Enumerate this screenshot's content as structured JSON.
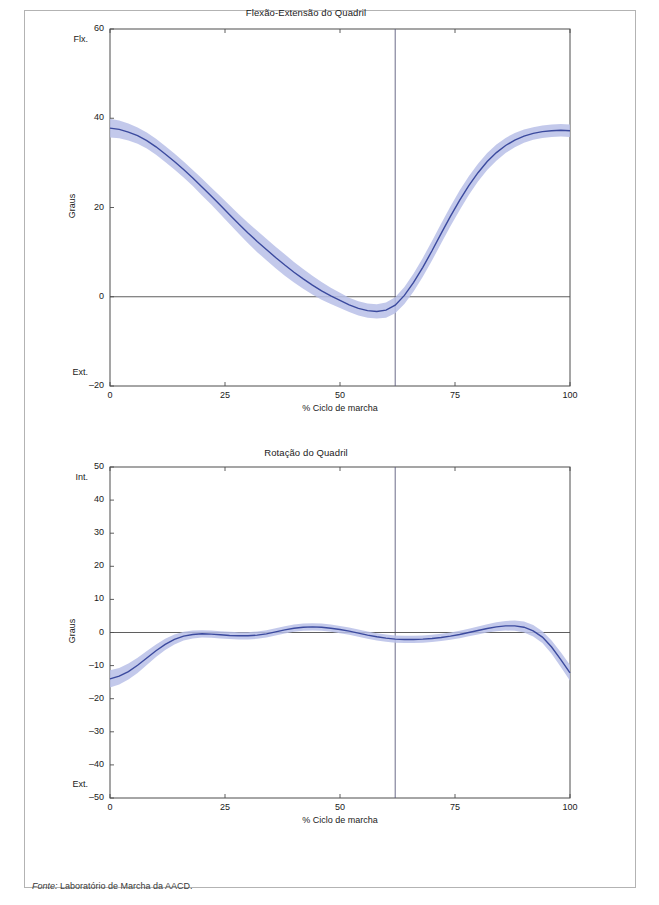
{
  "figure": {
    "source_prefix": "Fonte:",
    "source_text": " Laboratório de Marcha da AACD."
  },
  "colors": {
    "mean_line": "#3b4a9e",
    "band": "#b9c0e8",
    "axis": "#4d4d4d",
    "frame": "#b3b3b3",
    "event_line": "#5a5a7a"
  },
  "chart_data": [
    {
      "type": "line",
      "id": "flexao-extensao-quadril",
      "title": "Flexão-Extensão do Quadril",
      "xlabel": "% Ciclo de marcha",
      "ylabel": "Graus",
      "xlim": [
        0,
        100
      ],
      "ylim": [
        -20,
        60
      ],
      "grid": false,
      "legend": "none",
      "xticks": [
        0,
        25,
        50,
        75,
        100
      ],
      "xtick_labels": [
        "0",
        "25",
        "50",
        "75",
        "100"
      ],
      "yticks": [
        -20,
        0,
        20,
        40,
        60
      ],
      "ytick_labels": [
        "–20",
        "0",
        "20",
        "40",
        "60"
      ],
      "axis_end_labels": {
        "top": "Flx.",
        "bottom": "Ext."
      },
      "annotations": [
        {
          "type": "vline",
          "x": 62,
          "label": "toe-off"
        },
        {
          "type": "hline",
          "y": 0,
          "label": "zero-degrees"
        }
      ],
      "x": [
        0,
        2,
        4,
        6,
        8,
        10,
        12,
        14,
        16,
        18,
        20,
        22,
        24,
        26,
        28,
        30,
        32,
        34,
        36,
        38,
        40,
        42,
        44,
        46,
        48,
        50,
        52,
        54,
        56,
        58,
        60,
        62,
        64,
        66,
        68,
        70,
        72,
        74,
        76,
        78,
        80,
        82,
        84,
        86,
        88,
        90,
        92,
        94,
        96,
        98,
        100
      ],
      "series": [
        {
          "name": "Média",
          "values": [
            37.8,
            37.5,
            36.9,
            36.1,
            35.0,
            33.6,
            32.0,
            30.3,
            28.5,
            26.6,
            24.6,
            22.6,
            20.5,
            18.4,
            16.3,
            14.3,
            12.4,
            10.6,
            8.8,
            7.1,
            5.5,
            4.0,
            2.6,
            1.3,
            0.2,
            -0.8,
            -1.8,
            -2.6,
            -3.1,
            -3.3,
            -3.0,
            -1.9,
            0.3,
            3.2,
            6.6,
            10.3,
            14.2,
            18.0,
            21.6,
            24.9,
            27.8,
            30.3,
            32.3,
            33.9,
            35.1,
            36.0,
            36.6,
            37.0,
            37.2,
            37.3,
            37.2
          ]
        },
        {
          "name": "Desvio superior",
          "values": [
            39.9,
            39.5,
            38.8,
            37.9,
            36.8,
            35.4,
            33.8,
            32.1,
            30.3,
            28.4,
            26.5,
            24.5,
            22.5,
            20.5,
            18.5,
            16.6,
            14.8,
            13.0,
            11.2,
            9.5,
            7.8,
            6.2,
            4.7,
            3.3,
            2.0,
            0.9,
            -0.2,
            -1.0,
            -1.5,
            -1.7,
            -1.3,
            -0.1,
            2.2,
            5.2,
            8.7,
            12.5,
            16.4,
            20.2,
            23.8,
            27.0,
            29.8,
            32.2,
            34.1,
            35.6,
            36.7,
            37.5,
            38.0,
            38.4,
            38.6,
            38.7,
            38.6
          ]
        },
        {
          "name": "Desvio inferior",
          "values": [
            35.7,
            35.5,
            35.0,
            34.3,
            33.2,
            31.8,
            30.2,
            28.5,
            26.7,
            24.8,
            22.7,
            20.7,
            18.5,
            16.3,
            14.1,
            12.0,
            10.0,
            8.2,
            6.4,
            4.7,
            3.2,
            1.8,
            0.5,
            -0.7,
            -1.6,
            -2.5,
            -3.4,
            -4.2,
            -4.7,
            -4.9,
            -4.7,
            -3.7,
            -1.6,
            1.2,
            4.5,
            8.1,
            12.0,
            15.8,
            19.4,
            22.8,
            25.8,
            28.4,
            30.5,
            32.2,
            33.5,
            34.5,
            35.2,
            35.6,
            35.8,
            35.9,
            35.8
          ]
        }
      ]
    },
    {
      "type": "line",
      "id": "rotacao-quadril",
      "title": "Rotação do Quadril",
      "xlabel": "% Ciclo de marcha",
      "ylabel": "Graus",
      "xlim": [
        0,
        100
      ],
      "ylim": [
        -50,
        50
      ],
      "grid": false,
      "legend": "none",
      "xticks": [
        0,
        25,
        50,
        75,
        100
      ],
      "xtick_labels": [
        "0",
        "25",
        "50",
        "75",
        "100"
      ],
      "yticks": [
        -50,
        -40,
        -30,
        -20,
        -10,
        0,
        10,
        20,
        30,
        40,
        50
      ],
      "ytick_labels": [
        "–50",
        "–40",
        "–30",
        "–20",
        "–10",
        "0",
        "10",
        "20",
        "30",
        "40",
        "50"
      ],
      "axis_end_labels": {
        "top": "Int.",
        "bottom": "Ext."
      },
      "annotations": [
        {
          "type": "vline",
          "x": 62,
          "label": "toe-off"
        },
        {
          "type": "hline",
          "y": 0,
          "label": "zero-degrees"
        }
      ],
      "x": [
        0,
        2,
        4,
        6,
        8,
        10,
        12,
        14,
        16,
        18,
        20,
        22,
        24,
        26,
        28,
        30,
        32,
        34,
        36,
        38,
        40,
        42,
        44,
        46,
        48,
        50,
        52,
        54,
        56,
        58,
        60,
        62,
        64,
        66,
        68,
        70,
        72,
        74,
        76,
        78,
        80,
        82,
        84,
        86,
        88,
        90,
        92,
        94,
        96,
        98,
        100
      ],
      "series": [
        {
          "name": "Média",
          "values": [
            -14.0,
            -13.2,
            -11.8,
            -9.9,
            -7.7,
            -5.5,
            -3.6,
            -2.1,
            -1.1,
            -0.6,
            -0.4,
            -0.5,
            -0.7,
            -0.9,
            -1.0,
            -1.0,
            -0.8,
            -0.4,
            0.2,
            0.8,
            1.3,
            1.6,
            1.7,
            1.6,
            1.3,
            0.9,
            0.4,
            -0.2,
            -0.8,
            -1.3,
            -1.7,
            -2.0,
            -2.1,
            -2.1,
            -2.0,
            -1.8,
            -1.5,
            -1.1,
            -0.6,
            0.0,
            0.6,
            1.2,
            1.7,
            2.0,
            2.0,
            1.6,
            0.5,
            -1.4,
            -4.4,
            -8.2,
            -12.2
          ]
        },
        {
          "name": "Desvio superior",
          "values": [
            -11.4,
            -10.7,
            -9.4,
            -7.6,
            -5.6,
            -3.6,
            -1.9,
            -0.6,
            0.2,
            0.6,
            0.7,
            0.6,
            0.4,
            0.2,
            0.1,
            0.1,
            0.3,
            0.7,
            1.3,
            1.9,
            2.4,
            2.7,
            2.8,
            2.7,
            2.4,
            2.0,
            1.5,
            0.9,
            0.3,
            -0.2,
            -0.6,
            -0.9,
            -1.0,
            -1.0,
            -0.9,
            -0.7,
            -0.4,
            0.0,
            0.5,
            1.1,
            1.8,
            2.5,
            3.1,
            3.5,
            3.6,
            3.3,
            2.3,
            0.4,
            -2.4,
            -6.0,
            -9.8
          ]
        },
        {
          "name": "Desvio inferior",
          "values": [
            -16.6,
            -15.7,
            -14.2,
            -12.2,
            -9.8,
            -7.4,
            -5.3,
            -3.6,
            -2.4,
            -1.8,
            -1.5,
            -1.6,
            -1.8,
            -2.0,
            -2.1,
            -2.1,
            -1.9,
            -1.5,
            -0.9,
            -0.3,
            0.2,
            0.5,
            0.6,
            0.5,
            0.2,
            -0.2,
            -0.7,
            -1.3,
            -1.9,
            -2.4,
            -2.8,
            -3.1,
            -3.2,
            -3.2,
            -3.1,
            -2.9,
            -2.6,
            -2.2,
            -1.7,
            -1.1,
            -0.6,
            0.0,
            0.4,
            0.6,
            0.5,
            0.0,
            -1.2,
            -3.2,
            -6.4,
            -10.4,
            -14.6
          ]
        }
      ]
    }
  ]
}
